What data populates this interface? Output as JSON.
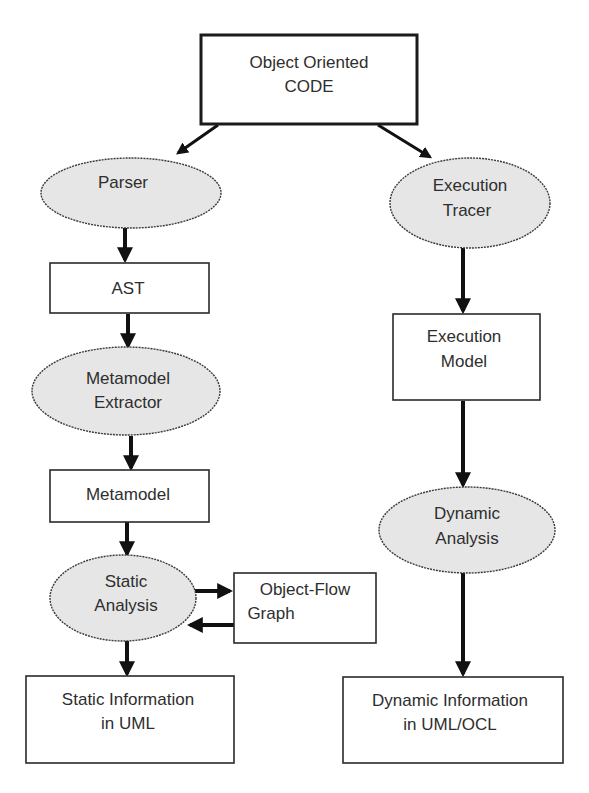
{
  "diagram": {
    "nodes": [
      {
        "id": "code",
        "shape": "rect",
        "lines": [
          "Object Oriented",
          "CODE"
        ]
      },
      {
        "id": "parser",
        "shape": "ellipse",
        "lines": [
          "Parser"
        ]
      },
      {
        "id": "ast",
        "shape": "rect",
        "lines": [
          "AST"
        ]
      },
      {
        "id": "extractor",
        "shape": "ellipse",
        "lines": [
          "Metamodel",
          "Extractor"
        ]
      },
      {
        "id": "metamodel",
        "shape": "rect",
        "lines": [
          "Metamodel"
        ]
      },
      {
        "id": "static_analysis",
        "shape": "ellipse",
        "lines": [
          "Static",
          "Analysis"
        ]
      },
      {
        "id": "ofg",
        "shape": "rect",
        "lines": [
          "Object-Flow",
          "Graph"
        ]
      },
      {
        "id": "static_info",
        "shape": "rect",
        "lines": [
          "Static Information",
          "in UML"
        ]
      },
      {
        "id": "tracer",
        "shape": "ellipse",
        "lines": [
          "Execution",
          "Tracer"
        ]
      },
      {
        "id": "exec_model",
        "shape": "rect",
        "lines": [
          "Execution",
          "Model"
        ]
      },
      {
        "id": "dynamic_analysis",
        "shape": "ellipse",
        "lines": [
          "Dynamic",
          "Analysis"
        ]
      },
      {
        "id": "dynamic_info",
        "shape": "rect",
        "lines": [
          "Dynamic Information",
          "in UML/OCL"
        ]
      }
    ],
    "edges": [
      {
        "from": "code",
        "to": "parser"
      },
      {
        "from": "code",
        "to": "tracer"
      },
      {
        "from": "parser",
        "to": "ast"
      },
      {
        "from": "ast",
        "to": "extractor"
      },
      {
        "from": "extractor",
        "to": "metamodel"
      },
      {
        "from": "metamodel",
        "to": "static_analysis"
      },
      {
        "from": "static_analysis",
        "to": "ofg"
      },
      {
        "from": "ofg",
        "to": "static_analysis"
      },
      {
        "from": "static_analysis",
        "to": "static_info"
      },
      {
        "from": "tracer",
        "to": "exec_model"
      },
      {
        "from": "exec_model",
        "to": "dynamic_analysis"
      },
      {
        "from": "dynamic_analysis",
        "to": "dynamic_info"
      }
    ]
  }
}
